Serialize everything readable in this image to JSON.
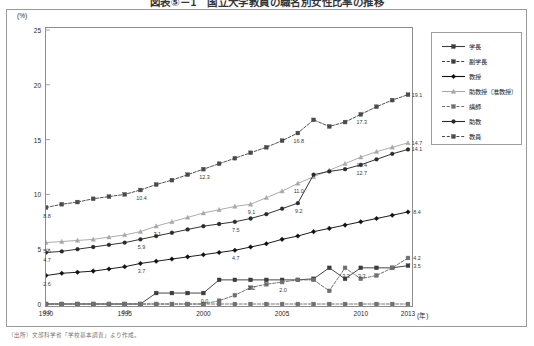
{
  "figure": {
    "title": "図表⑤－1　国立大学教員の職名別女性比率の推移",
    "unit_label": "(%)",
    "xaxis_unit": "(年)",
    "footnote": "（出所）文部科学省「学校基本調査」より作成。"
  },
  "legend": {
    "position": "right",
    "items": [
      {
        "label": "学長",
        "color": "#3d3d3d",
        "dash": "solid",
        "marker": "square"
      },
      {
        "label": "副学長",
        "color": "#3d3d3d",
        "dash": "dashed",
        "marker": "square"
      },
      {
        "label": "教授",
        "color": "#111111",
        "dash": "solid",
        "marker": "diamond"
      },
      {
        "label": "助教授（准教授）",
        "color": "#a8a8a8",
        "dash": "solid",
        "marker": "triangle"
      },
      {
        "label": "講師",
        "color": "#6f6f6f",
        "dash": "dashed",
        "marker": "square"
      },
      {
        "label": "助教",
        "color": "#2a2a2a",
        "dash": "solid",
        "marker": "circle"
      },
      {
        "label": "教員",
        "color": "#4a4a4a",
        "dash": "dashed",
        "marker": "square"
      }
    ]
  },
  "chart_data": {
    "type": "line",
    "title": "図表⑤－1　国立大学教員の職名別女性比率の推移",
    "xlabel": "(年)",
    "ylabel": "(%)",
    "xlim": [
      1990,
      2013
    ],
    "ylim": [
      0,
      25
    ],
    "yticks": [
      0,
      5,
      10,
      15,
      20,
      25
    ],
    "xticks": [
      1990,
      1995,
      2000,
      2005,
      2010,
      2013
    ],
    "grid": false,
    "x": [
      1990,
      1991,
      1992,
      1993,
      1994,
      1995,
      1996,
      1997,
      1998,
      1999,
      2000,
      2001,
      2002,
      2003,
      2004,
      2005,
      2006,
      2007,
      2008,
      2009,
      2010,
      2011,
      2012,
      2013
    ],
    "series": [
      {
        "name": "教員",
        "color": "#4a4a4a",
        "dash": "dashed",
        "marker": "square",
        "values": [
          8.8,
          9.1,
          9.3,
          9.6,
          9.8,
          10.0,
          10.4,
          10.9,
          11.3,
          11.8,
          12.3,
          12.8,
          13.3,
          13.8,
          14.3,
          14.9,
          15.6,
          16.8,
          16.2,
          16.6,
          17.3,
          18.0,
          18.6,
          19.1
        ],
        "labels": {
          "1990": "8.8",
          "1996": "10.4",
          "2000": "12.3",
          "2006": "16.8",
          "2010": "17.3",
          "2013": "19.1"
        }
      },
      {
        "name": "助教授（准教授）",
        "color": "#a8a8a8",
        "dash": "solid",
        "marker": "triangle",
        "values": [
          5.6,
          5.7,
          5.8,
          5.9,
          6.1,
          6.3,
          6.6,
          7.1,
          7.5,
          7.9,
          8.3,
          8.6,
          8.9,
          9.1,
          9.7,
          10.3,
          11.0,
          11.6,
          12.2,
          12.8,
          13.4,
          13.9,
          14.3,
          14.7
        ],
        "labels": {
          "1990": "5.6",
          "1997": "7.1",
          "2003": "9.1",
          "2006": "11.0",
          "2010": "13.4",
          "2013": "14.7"
        }
      },
      {
        "name": "助教",
        "color": "#2a2a2a",
        "dash": "solid",
        "marker": "circle",
        "values": [
          4.7,
          4.8,
          5.0,
          5.2,
          5.4,
          5.6,
          5.9,
          6.2,
          6.5,
          6.8,
          7.1,
          7.3,
          7.5,
          7.8,
          8.2,
          8.7,
          9.2,
          11.8,
          12.1,
          12.3,
          12.7,
          13.2,
          13.7,
          14.1
        ],
        "labels": {
          "1990": "4.7",
          "1996": "5.9",
          "2002": "7.5",
          "2006": "9.2",
          "2010": "12.7",
          "2013": "14.1"
        }
      },
      {
        "name": "教授",
        "color": "#111111",
        "dash": "solid",
        "marker": "diamond",
        "values": [
          2.6,
          2.8,
          2.9,
          3.0,
          3.2,
          3.4,
          3.7,
          3.9,
          4.1,
          4.3,
          4.5,
          4.7,
          4.9,
          5.2,
          5.5,
          5.9,
          6.2,
          6.6,
          6.9,
          7.2,
          7.5,
          7.8,
          8.1,
          8.4
        ],
        "labels": {
          "1990": "2.6",
          "1996": "3.7",
          "2002": "4.7",
          "2013": "8.4"
        }
      },
      {
        "name": "学長",
        "color": "#3d3d3d",
        "dash": "solid",
        "marker": "square",
        "values": [
          0.0,
          0.0,
          0.0,
          0.0,
          0.0,
          0.0,
          0.0,
          1.0,
          1.0,
          1.0,
          1.0,
          2.2,
          2.2,
          2.2,
          2.2,
          2.2,
          2.2,
          2.3,
          3.3,
          2.3,
          3.3,
          3.3,
          3.3,
          3.5
        ],
        "labels": {
          "1990": "0.0",
          "1995": "0.0",
          "2000": "0.0",
          "2003": "2.2",
          "2010": "3.3",
          "2013": "3.5"
        }
      },
      {
        "name": "副学長",
        "color": "#6f6f6f",
        "dash": "dashed",
        "marker": "square",
        "values": [
          0.0,
          0.0,
          0.0,
          0.0,
          0.0,
          0.0,
          0.0,
          0.0,
          0.0,
          0.0,
          0.0,
          0.3,
          0.8,
          1.5,
          1.8,
          2.0,
          2.2,
          2.2,
          1.2,
          3.3,
          2.3,
          2.6,
          3.3,
          4.2
        ],
        "labels": {
          "2005": "2.0",
          "2009": "3.3",
          "2013": "4.2"
        }
      },
      {
        "name": "講師",
        "color": "#6f6f6f",
        "dash": "dashed",
        "marker": "square",
        "values": [
          0.0,
          0.0,
          0.0,
          0.0,
          0.0,
          0.0,
          0.0,
          0.0,
          0.0,
          0.0,
          0.0,
          0.0,
          0.0,
          0.0,
          0.0,
          0.0,
          0.0,
          0.0,
          0.0,
          0.0,
          0.0,
          0.0,
          0.0,
          0.0
        ],
        "labels": {}
      }
    ]
  }
}
